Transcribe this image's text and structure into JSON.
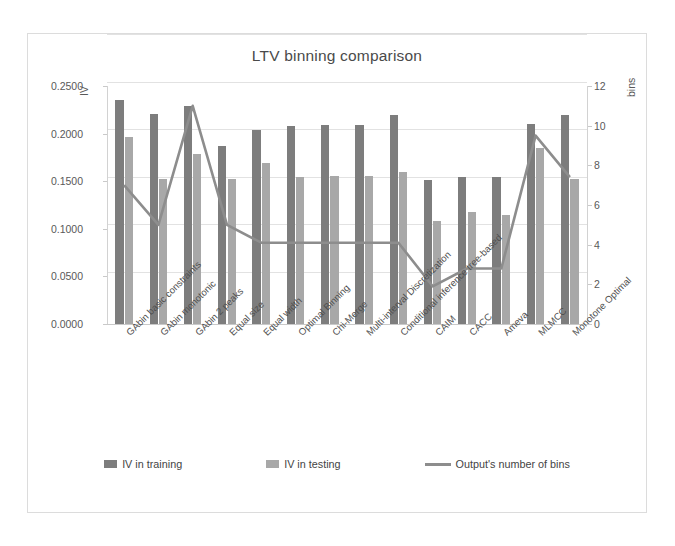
{
  "chart_data": {
    "type": "bar",
    "title": "LTV binning comparison",
    "xlabel": "",
    "ylabel": "IV",
    "y2label": "bins",
    "ylim": [
      0.0,
      0.25
    ],
    "y2lim": [
      0,
      12
    ],
    "grid": true,
    "legend_position": "bottom",
    "ytick_labels": [
      "0.2500",
      "0.2000",
      "0.1500",
      "0.1000",
      "0.0500",
      "0.0000"
    ],
    "ytick_values": [
      0.25,
      0.2,
      0.15,
      0.1,
      0.05,
      0.0
    ],
    "y2tick_labels": [
      "12",
      "10",
      "8",
      "6",
      "4",
      "2",
      "0"
    ],
    "y2tick_values": [
      12,
      10,
      8,
      6,
      4,
      2,
      0
    ],
    "categories": [
      "GAbin basic constraints",
      "GAbin monotonic",
      "GAbin 2 peaks",
      "Equal size",
      "Equal width",
      "Optimal Binning",
      "Chi-Merge",
      "Multi-interval Discretization",
      "Conditional inference tree-based",
      "CAIM",
      "CACC",
      "Ameva",
      "MLMCC",
      "Monotone Optimal"
    ],
    "series": [
      {
        "name": "IV in training",
        "type": "bar",
        "axis": "left",
        "color": "#7d7d7d",
        "values": [
          0.2355,
          0.2205,
          0.2285,
          0.1865,
          0.2035,
          0.2085,
          0.209,
          0.209,
          0.2195,
          0.151,
          0.1545,
          0.1545,
          0.21,
          0.2195
        ]
      },
      {
        "name": "IV in testing",
        "type": "bar",
        "axis": "left",
        "color": "#a8a8a8",
        "values": [
          0.196,
          0.152,
          0.179,
          0.1525,
          0.169,
          0.1545,
          0.1555,
          0.155,
          0.1595,
          0.1085,
          0.1175,
          0.115,
          0.185,
          0.152
        ]
      },
      {
        "name": "Output's number of bins",
        "type": "line",
        "axis": "right",
        "color": "#8d8d8d",
        "values": [
          7.0,
          5.0,
          11.0,
          5.0,
          4.1,
          4.1,
          4.1,
          4.1,
          4.1,
          1.9,
          2.8,
          2.8,
          9.5,
          7.4
        ]
      }
    ],
    "legend": [
      {
        "label": "IV in training",
        "marker": "bar",
        "color": "#7d7d7d"
      },
      {
        "label": "IV in testing",
        "marker": "bar",
        "color": "#a8a8a8"
      },
      {
        "label": "Output's number of bins",
        "marker": "line",
        "color": "#8d8d8d"
      }
    ]
  }
}
